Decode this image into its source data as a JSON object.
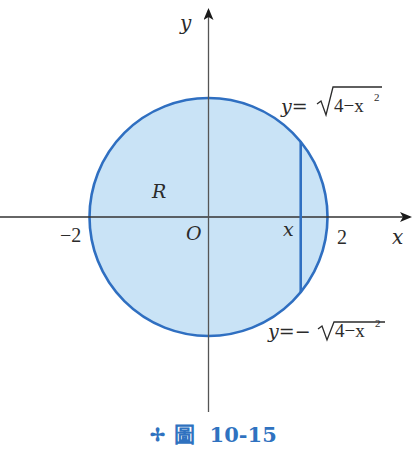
{
  "figure": {
    "caption_marker": "✢",
    "caption": "圖  10-15"
  },
  "axes": {
    "x_label": "x",
    "y_label": "y",
    "origin_label": "O",
    "range": [
      -2,
      2
    ]
  },
  "labels": {
    "neg_two": "−2",
    "pos_two": "2",
    "x_slice": "x",
    "region": "R",
    "upper_curve_prefix": "y=",
    "upper_curve_radicand": "4−x",
    "lower_curve_prefix": "y=−",
    "lower_curve_radicand": "4−x",
    "exponent": "2"
  },
  "region": {
    "shape": "disk",
    "radius": 2,
    "fill_color": "#c9e3f6",
    "stroke_color": "#2f6fc1"
  },
  "slice": {
    "x_value": 1.55
  },
  "colors": {
    "axis": "#333333",
    "caption": "#2f72c0"
  }
}
